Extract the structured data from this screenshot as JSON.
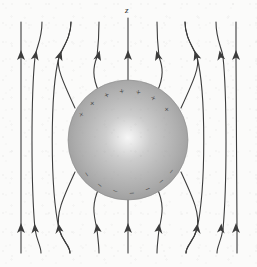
{
  "figure": {
    "width": 257,
    "height": 267,
    "background_color": "#fbfbfa"
  },
  "axis": {
    "label": "z",
    "label_x": 125,
    "label_y": 6
  },
  "sphere": {
    "center_x": 128,
    "center_y": 140,
    "radius": 60,
    "fill_light": "#f2f2f2",
    "fill_mid": "#b4b4b4",
    "fill_dark": "#8d8d8d",
    "highlight_x": 128,
    "highlight_y": 138,
    "edge_color": "#6f6f6f"
  },
  "charges": {
    "positive_symbol": "+",
    "negative_symbol": "−",
    "positive_color": "#3a3a3a",
    "negative_color": "#3a3a3a",
    "positive_label": "induced-positive-charge",
    "negative_label": "induced-negative-charge",
    "positive": [
      {
        "x": 82,
        "y": 115,
        "rot": -58
      },
      {
        "x": 93,
        "y": 104,
        "rot": -44
      },
      {
        "x": 107,
        "y": 96,
        "rot": -28
      },
      {
        "x": 122,
        "y": 92,
        "rot": -8
      },
      {
        "x": 138,
        "y": 93,
        "rot": 9
      },
      {
        "x": 153,
        "y": 99,
        "rot": 26
      },
      {
        "x": 166,
        "y": 110,
        "rot": 44
      }
    ],
    "negative": [
      {
        "x": 86,
        "y": 175,
        "rot": 56
      },
      {
        "x": 99,
        "y": 186,
        "rot": 38
      },
      {
        "x": 115,
        "y": 192,
        "rot": 18
      },
      {
        "x": 132,
        "y": 194,
        "rot": -4
      },
      {
        "x": 148,
        "y": 190,
        "rot": -22
      },
      {
        "x": 162,
        "y": 182,
        "rot": -40
      },
      {
        "x": 172,
        "y": 172,
        "rot": -54
      }
    ]
  },
  "field": {
    "line_color": "#3c3c3c",
    "line_width": 1.1,
    "direction": "upward",
    "arrow_rows_y": [
      55,
      228
    ],
    "lines": [
      {
        "name": "field-line-1",
        "x_top": 21,
        "x_bottom": 21,
        "type": "straight",
        "bend": 0
      },
      {
        "name": "field-line-2",
        "x_top": 42,
        "x_bottom": 41,
        "type": "curved",
        "bend": -9
      },
      {
        "name": "field-line-3",
        "x_top": 71,
        "x_bottom": 70,
        "type": "curved",
        "bend": -22
      },
      {
        "name": "field-line-4",
        "x_top": 128,
        "x_bottom": 128,
        "type": "axis",
        "bend": 0
      },
      {
        "name": "field-line-5",
        "x_top": 185,
        "x_bottom": 186,
        "type": "curved",
        "bend": 22
      },
      {
        "name": "field-line-6",
        "x_top": 216,
        "x_bottom": 217,
        "type": "curved",
        "bend": 9
      },
      {
        "name": "field-line-7",
        "x_top": 236,
        "x_bottom": 237,
        "type": "straight",
        "bend": 0
      }
    ],
    "entering_lines": [
      {
        "name": "entry-line-left-outer",
        "x_end": 71,
        "surface_angle": 208
      },
      {
        "name": "entry-line-left-inner",
        "x_end": 95,
        "surface_angle": 234
      },
      {
        "name": "entry-line-axis",
        "x_end": 128,
        "surface_angle": 270
      },
      {
        "name": "entry-line-right-inner",
        "x_end": 161,
        "surface_angle": 306
      },
      {
        "name": "entry-line-right-outer",
        "x_end": 185,
        "surface_angle": 332
      }
    ]
  }
}
